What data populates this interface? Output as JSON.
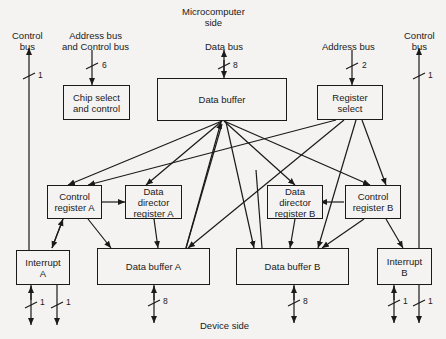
{
  "diagram": {
    "top_label": "Microcomputer\nside",
    "bottom_label": "Device side",
    "buses": {
      "control_bus_left": {
        "label": "Control\nbus",
        "width": "1"
      },
      "address_control_bus": {
        "label": "Address bus\nand Control bus",
        "width": "6"
      },
      "data_bus": {
        "label": "Data bus",
        "width": "8"
      },
      "address_bus": {
        "label": "Address bus",
        "width": "2"
      },
      "control_bus_right": {
        "label": "Control\nbus",
        "width": "1"
      }
    },
    "blocks": {
      "chip_select": "Chip select\nand control",
      "data_buffer": "Data buffer",
      "register_select": "Register\nselect",
      "control_register_a": "Control\nregister A",
      "ddr_a": "Data\ndirector\nregister A",
      "ddr_b": "Data\ndirector\nregister B",
      "control_register_b": "Control\nregister B",
      "interrupt_a": "Interrupt\nA",
      "data_buffer_a": "Data buffer A",
      "data_buffer_b": "Data buffer B",
      "interrupt_b": "Interrupt\nB"
    },
    "device_lines": {
      "interrupt_a_1": "1",
      "interrupt_a_2": "1",
      "data_buffer_a": "8",
      "data_buffer_b": "8",
      "interrupt_b_1": "1",
      "interrupt_b_2": "1"
    }
  }
}
